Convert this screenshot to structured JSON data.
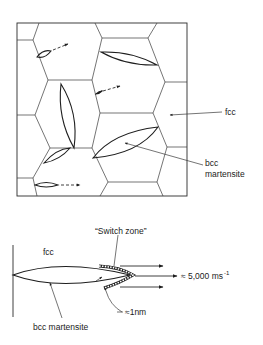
{
  "figure_top": {
    "title": "Grain structure with martensite plates",
    "labels": {
      "fcc": "fcc",
      "bcc_line1": "bcc",
      "bcc_line2": "martensite"
    }
  },
  "figure_bottom": {
    "title": "Martensite plate growth",
    "labels": {
      "fcc": "fcc",
      "switch_zone": "“Switch zone”",
      "velocity": "≈ 5,000 ms",
      "velocity_exp": "-1",
      "thickness": "≈1nm",
      "bcc_martensite": "bcc martensite"
    }
  },
  "colors": {
    "line": "#2a2a2a",
    "background": "#ffffff"
  }
}
